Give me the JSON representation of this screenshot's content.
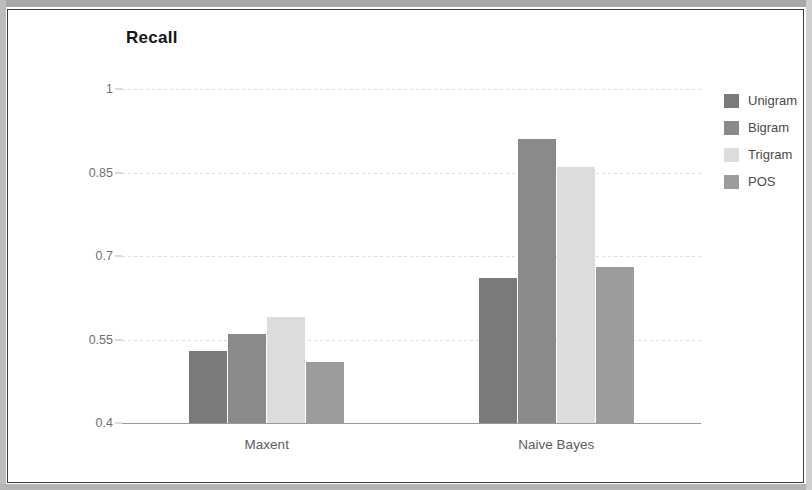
{
  "chart_data": {
    "type": "bar",
    "title": "Recall",
    "xlabel": "",
    "ylabel": "",
    "categories": [
      "Maxent",
      "Naive Bayes"
    ],
    "series": [
      {
        "name": "Unigram",
        "color": "#7a7a7a",
        "values": [
          0.53,
          0.66
        ]
      },
      {
        "name": "Bigram",
        "color": "#8a8a8a",
        "values": [
          0.56,
          0.91
        ]
      },
      {
        "name": "Trigram",
        "color": "#dcdcdc",
        "values": [
          0.59,
          0.86
        ]
      },
      {
        "name": "POS",
        "color": "#9c9c9c",
        "values": [
          0.51,
          0.68
        ]
      }
    ],
    "ylim": [
      0.4,
      1
    ],
    "yticks": [
      0.4,
      0.55,
      0.7,
      0.85,
      1
    ],
    "ytick_labels": [
      "0.4",
      "0.55",
      "0.7",
      "0.85",
      "1"
    ],
    "grid": true,
    "legend_position": "right"
  },
  "colors": {
    "title": "#161616",
    "tick_label": "#6f6f6f",
    "category_label": "#5d5d5d",
    "gridline": "#d9dde0",
    "axis": "#9a9a9a",
    "frame": "#3c3c3c",
    "canvas": "#ffffff"
  }
}
